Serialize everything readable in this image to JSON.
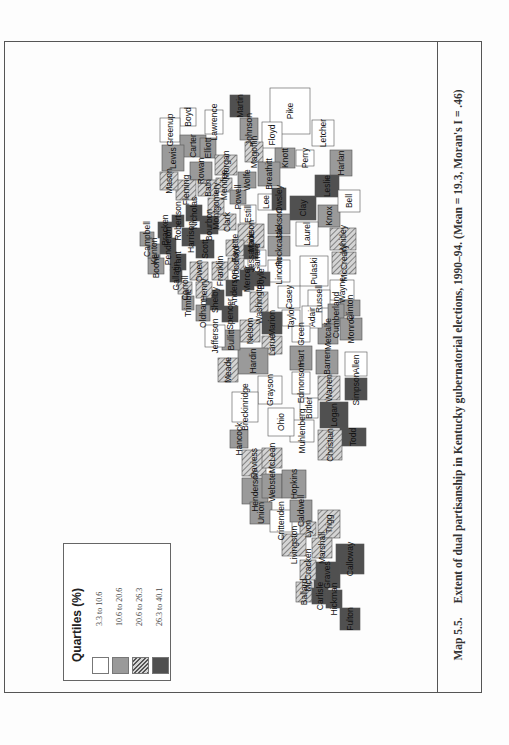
{
  "caption": {
    "number": "Map 5.5.",
    "text": "Extent of dual partisanship in Kentucky gubernatorial elections, 1990–94. (Mean = 19.3, Moran's I = .46)"
  },
  "legend": {
    "title": "Quartiles (%)",
    "items": [
      {
        "label": "3.3 to 10.6",
        "fill": "#ffffff",
        "pattern": "none"
      },
      {
        "label": "10.6 to 20.6",
        "fill": "#9a9a9a",
        "pattern": "none"
      },
      {
        "label": "20.6 to 26.3",
        "fill": "#c8c8c8",
        "pattern": "hatch"
      },
      {
        "label": "26.3 to 40.1",
        "fill": "#505050",
        "pattern": "none"
      }
    ]
  },
  "map": {
    "title": "Kentucky counties",
    "counties": [
      {
        "name": "Pike",
        "q": 1
      },
      {
        "name": "Martin",
        "q": 4
      },
      {
        "name": "Johnson",
        "q": 2
      },
      {
        "name": "Lawrence",
        "q": 1
      },
      {
        "name": "Boyd",
        "q": 1
      },
      {
        "name": "Greenup",
        "q": 1
      },
      {
        "name": "Carter",
        "q": 2
      },
      {
        "name": "Elliott",
        "q": 2
      },
      {
        "name": "Floyd",
        "q": 1
      },
      {
        "name": "Magoffin",
        "q": 3
      },
      {
        "name": "Morgan",
        "q": 3
      },
      {
        "name": "Knott",
        "q": 2
      },
      {
        "name": "Letcher",
        "q": 1
      },
      {
        "name": "Harlan",
        "q": 2
      },
      {
        "name": "Perry",
        "q": 1
      },
      {
        "name": "Leslie",
        "q": 4
      },
      {
        "name": "Breathitt",
        "q": 2
      },
      {
        "name": "Wolfe",
        "q": 2
      },
      {
        "name": "Lewis",
        "q": 2
      },
      {
        "name": "Rowan",
        "q": 2
      },
      {
        "name": "Bath",
        "q": 3
      },
      {
        "name": "Fleming",
        "q": 3
      },
      {
        "name": "Mason",
        "q": 3
      },
      {
        "name": "Menifee",
        "q": 3
      },
      {
        "name": "Powell",
        "q": 2
      },
      {
        "name": "Estill",
        "q": 1
      },
      {
        "name": "Lee",
        "q": 1
      },
      {
        "name": "Owsley",
        "q": 4
      },
      {
        "name": "Clay",
        "q": 4
      },
      {
        "name": "Knox",
        "q": 2
      },
      {
        "name": "Bell",
        "q": 1
      },
      {
        "name": "Whitley",
        "q": 3
      },
      {
        "name": "McCreary",
        "q": 3
      },
      {
        "name": "Laurel",
        "q": 1
      },
      {
        "name": "Jackson",
        "q": 2
      },
      {
        "name": "Rockcastle",
        "q": 2
      },
      {
        "name": "Madison",
        "q": 3
      },
      {
        "name": "Garrard",
        "q": 1
      },
      {
        "name": "Lincoln",
        "q": 1
      },
      {
        "name": "Pulaski",
        "q": 1
      },
      {
        "name": "Wayne",
        "q": 1
      },
      {
        "name": "Russell",
        "q": 1
      },
      {
        "name": "Clinton",
        "q": 2
      },
      {
        "name": "Cumberland",
        "q": 2
      },
      {
        "name": "Monroe",
        "q": 2
      },
      {
        "name": "Metcalfe",
        "q": 2
      },
      {
        "name": "Adair",
        "q": 1
      },
      {
        "name": "Casey",
        "q": 1
      },
      {
        "name": "Taylor",
        "q": 1
      },
      {
        "name": "Green",
        "q": 1
      },
      {
        "name": "Boyle",
        "q": 4
      },
      {
        "name": "Mercer",
        "q": 4
      },
      {
        "name": "Washington",
        "q": 3
      },
      {
        "name": "Marion",
        "q": 4
      },
      {
        "name": "Nelson",
        "q": 3
      },
      {
        "name": "Larue",
        "q": 3
      },
      {
        "name": "Hart",
        "q": 2
      },
      {
        "name": "Barren",
        "q": 2
      },
      {
        "name": "Allen",
        "q": 1
      },
      {
        "name": "Simpson",
        "q": 4
      },
      {
        "name": "Warren",
        "q": 3
      },
      {
        "name": "Edmonson",
        "q": 1
      },
      {
        "name": "Butler",
        "q": 1
      },
      {
        "name": "Logan",
        "q": 4
      },
      {
        "name": "Todd",
        "q": 4
      },
      {
        "name": "Christian",
        "q": 3
      },
      {
        "name": "Muhlenberg",
        "q": 1
      },
      {
        "name": "Ohio",
        "q": 1
      },
      {
        "name": "Grayson",
        "q": 1
      },
      {
        "name": "Breckinridge",
        "q": 1
      },
      {
        "name": "Hardin",
        "q": 2
      },
      {
        "name": "Meade",
        "q": 3
      },
      {
        "name": "Bullitt",
        "q": 2
      },
      {
        "name": "Jefferson",
        "q": 1
      },
      {
        "name": "Spencer",
        "q": 4
      },
      {
        "name": "Anderson",
        "q": 4
      },
      {
        "name": "Shelby",
        "q": 4
      },
      {
        "name": "Franklin",
        "q": 3
      },
      {
        "name": "Woodford",
        "q": 3
      },
      {
        "name": "Fayette",
        "q": 3
      },
      {
        "name": "Jessamine",
        "q": 4
      },
      {
        "name": "Clark",
        "q": 3
      },
      {
        "name": "Montgomery",
        "q": 3
      },
      {
        "name": "Bourbon",
        "q": 4
      },
      {
        "name": "Scott",
        "q": 4
      },
      {
        "name": "Harrison",
        "q": 4
      },
      {
        "name": "Nicholas",
        "q": 4
      },
      {
        "name": "Robertson",
        "q": 4
      },
      {
        "name": "Bracken",
        "q": 4
      },
      {
        "name": "Pendleton",
        "q": 4
      },
      {
        "name": "Grant",
        "q": 4
      },
      {
        "name": "Owen",
        "q": 3
      },
      {
        "name": "Henry",
        "q": 3
      },
      {
        "name": "Oldham",
        "q": 2
      },
      {
        "name": "Trimble",
        "q": 2
      },
      {
        "name": "Carroll",
        "q": 3
      },
      {
        "name": "Gallatin",
        "q": 4
      },
      {
        "name": "Boone",
        "q": 2
      },
      {
        "name": "Kenton",
        "q": 2
      },
      {
        "name": "Campbell",
        "q": 2
      },
      {
        "name": "Hancock",
        "q": 2
      },
      {
        "name": "Daviess",
        "q": 3
      },
      {
        "name": "McLean",
        "q": 3
      },
      {
        "name": "Henderson",
        "q": 2
      },
      {
        "name": "Webster",
        "q": 2
      },
      {
        "name": "Hopkins",
        "q": 2
      },
      {
        "name": "Union",
        "q": 2
      },
      {
        "name": "Crittenden",
        "q": 1
      },
      {
        "name": "Caldwell",
        "q": 2
      },
      {
        "name": "Lyon",
        "q": 3
      },
      {
        "name": "Trigg",
        "q": 3
      },
      {
        "name": "Livingston",
        "q": 3
      },
      {
        "name": "Marshall",
        "q": 3
      },
      {
        "name": "Calloway",
        "q": 4
      },
      {
        "name": "Graves",
        "q": 4
      },
      {
        "name": "McCracken",
        "q": 3
      },
      {
        "name": "Ballard",
        "q": 3
      },
      {
        "name": "Carlisle",
        "q": 4
      },
      {
        "name": "Hickman",
        "q": 4
      },
      {
        "name": "Fulton",
        "q": 4
      }
    ]
  }
}
